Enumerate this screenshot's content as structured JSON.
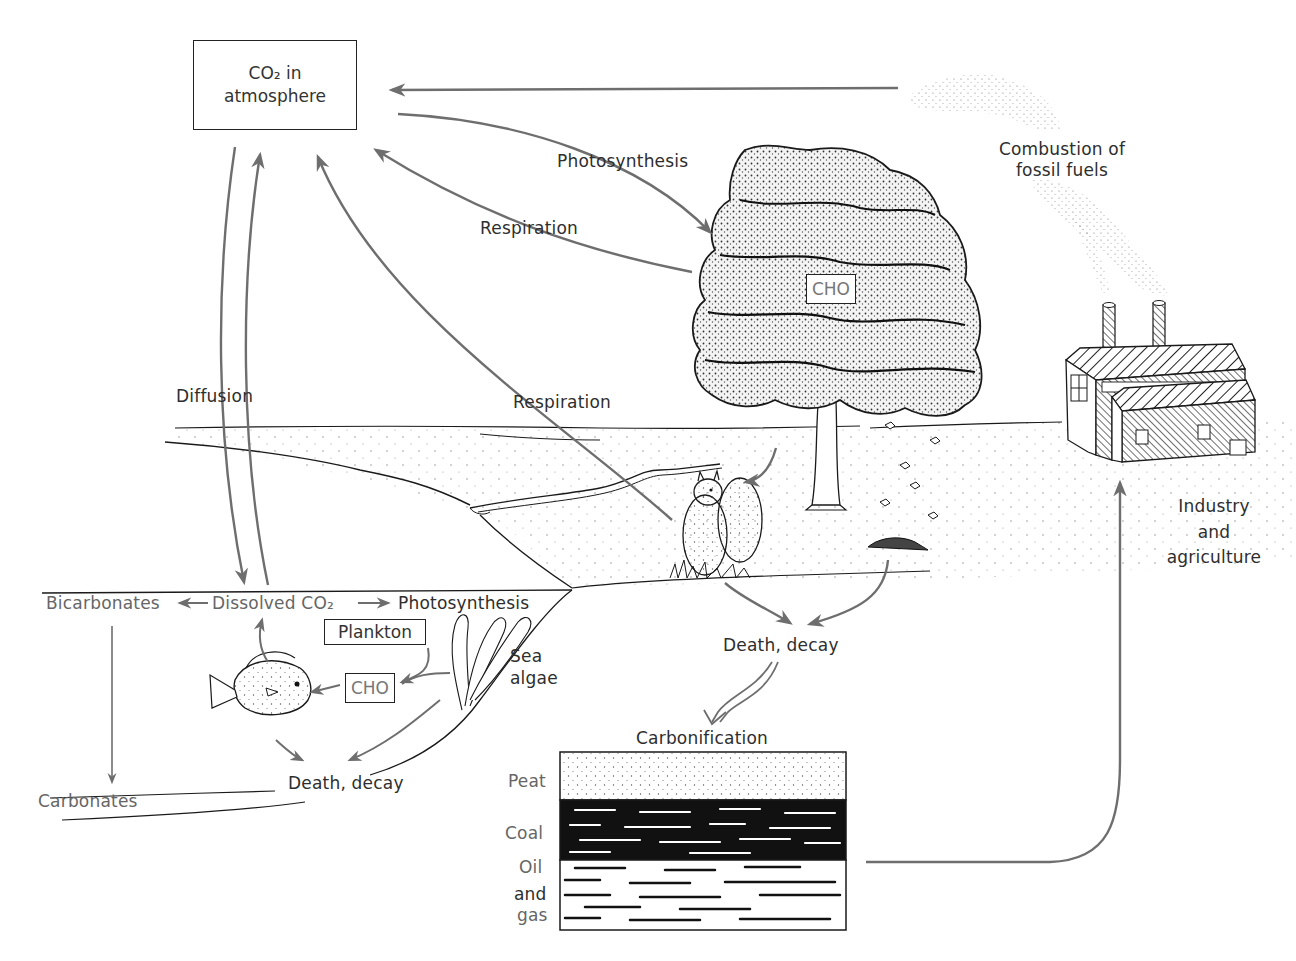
{
  "diagram": {
    "type": "carbon-cycle-illustration",
    "colors": {
      "ink": "#1a1a1a",
      "arrow": "#6e6e6e",
      "label": "#2e2e2e",
      "label_gray": "#666666",
      "background": "#ffffff"
    }
  },
  "atmosphere": {
    "box_line1": "CO₂ in",
    "box_line2": "atmosphere"
  },
  "land": {
    "photosynthesis": "Photosynthesis",
    "respiration_plants": "Respiration",
    "respiration_animals": "Respiration",
    "tree_cho": "CHO",
    "death_decay": "Death, decay",
    "carbonification": "Carbonification"
  },
  "industry": {
    "combustion_line1": "Combustion of",
    "combustion_line2": "fossil fuels",
    "industry_line1": "Industry",
    "industry_line2": "and",
    "industry_line3": "agriculture"
  },
  "ocean": {
    "diffusion": "Diffusion",
    "bicarbonates": "Bicarbonates",
    "dissolved_co2": "Dissolved CO₂",
    "photosynthesis": "Photosynthesis",
    "plankton": "Plankton",
    "cho": "CHO",
    "sea_algae_line1": "Sea",
    "sea_algae_line2": "algae",
    "death_decay": "Death, decay",
    "carbonates": "Carbonates"
  },
  "fossil_layers": [
    {
      "label": "Peat",
      "pattern": "stipple"
    },
    {
      "label": "Coal",
      "pattern": "black-streaks"
    },
    {
      "label": "Oil",
      "pattern": "white-streaks"
    },
    {
      "label": "and",
      "pattern": "white-streaks"
    },
    {
      "label": "gas",
      "pattern": "white-streaks"
    }
  ],
  "icons": [
    "tree-icon",
    "squirrel-icon",
    "factory-icon",
    "smoke-plume-icon",
    "fish-icon",
    "sea-algae-icon",
    "leaf-pile-icon",
    "river-icon"
  ]
}
